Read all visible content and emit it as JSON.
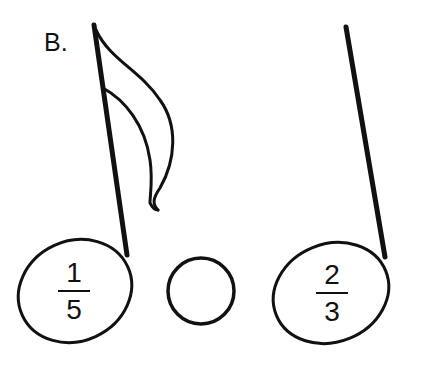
{
  "label": "B.",
  "notes": [
    {
      "type": "eighth-note",
      "numerator": "1",
      "denominator": "5"
    },
    {
      "type": "dot"
    },
    {
      "type": "quarter-note",
      "numerator": "2",
      "denominator": "3"
    }
  ],
  "colors": {
    "ink": "#111111",
    "background": "#ffffff"
  }
}
